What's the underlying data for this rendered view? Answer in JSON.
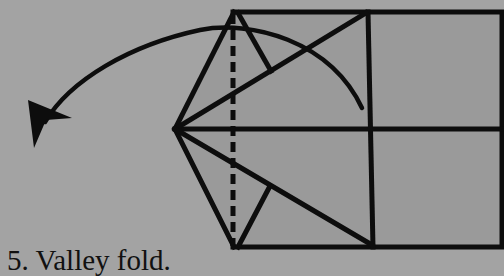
{
  "caption": {
    "step_number": "5.",
    "instruction": "Valley fold.",
    "full": "5. Valley fold."
  },
  "colors": {
    "background": "#a3a3a3",
    "paper": "#9a9a9a",
    "line": "#0d0d0d"
  },
  "diagram": {
    "type": "origami-step",
    "fold_type": "valley fold",
    "elements": [
      "paper-outline",
      "center-crease",
      "valley-fold-dashed-line",
      "fold-arrow"
    ]
  }
}
